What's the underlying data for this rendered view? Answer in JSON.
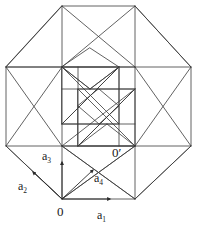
{
  "figure": {
    "name": "tesseract-lattice-projection",
    "stroke_color": "#3a3a3a",
    "label_color": "#1a1a1a",
    "background_color": "#ffffff",
    "stroke_width": 0.8,
    "width": 197,
    "height": 226
  },
  "labels": {
    "origin": "0",
    "origin_prime": "0′",
    "a1": "a",
    "a1_sub": "1",
    "a2": "a",
    "a2_sub": "2",
    "a3": "a",
    "a3_sub": "3",
    "a4": "a",
    "a4_sub": "4"
  },
  "geometry": {
    "outer_octagon": [
      [
        62,
        6
      ],
      [
        135,
        6
      ],
      [
        191,
        67
      ],
      [
        191,
        146
      ],
      [
        135,
        199
      ],
      [
        62,
        199
      ],
      [
        6,
        146
      ],
      [
        6,
        67
      ]
    ],
    "basis_vectors": [
      {
        "name": "a1",
        "from": [
          62,
          199
        ],
        "to": [
          135,
          199
        ],
        "direction": "right"
      },
      {
        "name": "a2",
        "from": [
          62,
          199
        ],
        "to": [
          6,
          146
        ],
        "direction": "up-left"
      },
      {
        "name": "a3",
        "from": [
          62,
          199
        ],
        "to": [
          62,
          146
        ],
        "direction": "up"
      },
      {
        "name": "a4",
        "from": [
          62,
          199
        ],
        "to": [
          112,
          152
        ],
        "direction": "up-right"
      }
    ],
    "origin_point": [
      62,
      199
    ],
    "origin_prime_point": [
      119,
      146
    ]
  }
}
